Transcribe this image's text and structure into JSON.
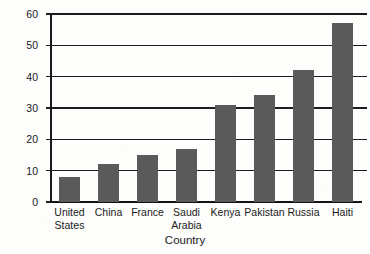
{
  "chart_data": {
    "type": "bar",
    "title": "",
    "xlabel": "Country",
    "ylabel": "Percentage of GDP",
    "categories": [
      "United States",
      "China",
      "France",
      "Saudi Arabia",
      "Kenya",
      "Pakistan",
      "Russia",
      "Haiti"
    ],
    "category_lines": [
      [
        "United",
        "States"
      ],
      [
        "China",
        ""
      ],
      [
        "France",
        ""
      ],
      [
        "Saudi",
        "Arabia"
      ],
      [
        "Kenya",
        ""
      ],
      [
        "Pakistan",
        ""
      ],
      [
        "Russia",
        ""
      ],
      [
        "Haiti",
        ""
      ]
    ],
    "values": [
      8,
      12,
      15,
      17,
      31,
      34,
      42,
      57
    ],
    "ylim": [
      0,
      60
    ],
    "ytick_labels": [
      "60",
      "50",
      "40",
      "30",
      "20",
      "10",
      "0"
    ],
    "ytick_values": [
      60,
      50,
      40,
      30,
      20,
      10,
      0
    ],
    "ytick_step": 10,
    "grid": true,
    "legend": "none",
    "bar_color": "#5a5a5a",
    "axis_color": "#1a1a1a",
    "background_color": "#fdfdfc"
  }
}
